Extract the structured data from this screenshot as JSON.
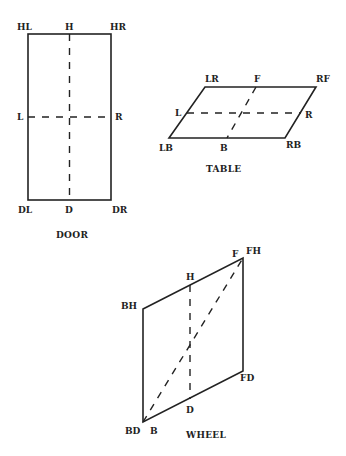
{
  "door": {
    "caption": "DOOR",
    "labels": {
      "HL": "HL",
      "H": "H",
      "HR": "HR",
      "L": "L",
      "R": "R",
      "DL": "DL",
      "D": "D",
      "DR": "DR"
    }
  },
  "table": {
    "caption": "TABLE",
    "labels": {
      "LR": "LR",
      "F": "F",
      "RF": "RF",
      "L": "L",
      "R": "R",
      "LB": "LB",
      "B": "B",
      "RB": "RB"
    }
  },
  "wheel": {
    "caption": "WHEEL",
    "labels": {
      "F": "F",
      "FH": "FH",
      "H": "H",
      "BH": "BH",
      "FD": "FD",
      "D": "D",
      "BD": "BD",
      "B": "B"
    }
  }
}
